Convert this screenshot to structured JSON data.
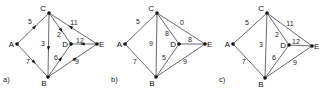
{
  "panels": [
    {
      "caption": "a)",
      "offset_x": 0,
      "directed": true,
      "nodes": {
        "A": [
          17,
          44
        ],
        "C": [
          49,
          13
        ],
        "B": [
          48,
          77
        ],
        "D": [
          71,
          44
        ],
        "E": [
          97,
          44
        ]
      },
      "edges": [
        {
          "from": "A",
          "to": "C",
          "w": "5",
          "lx": 30,
          "ly": 24
        },
        {
          "from": "A",
          "to": "B",
          "w": "7",
          "lx": 28,
          "ly": 64
        },
        {
          "from": "C",
          "to": "B",
          "w": "3",
          "lx": 43,
          "ly": 46
        },
        {
          "from": "C",
          "to": "D",
          "w": "2",
          "lx": 59,
          "ly": 37
        },
        {
          "from": "E",
          "to": "C",
          "w": "11",
          "lx": 74,
          "ly": 25
        },
        {
          "from": "E",
          "to": "D",
          "w": "12",
          "lx": 80,
          "ly": 43
        },
        {
          "from": "B",
          "to": "D",
          "w": "6",
          "lx": 56,
          "ly": 60
        },
        {
          "from": "B",
          "to": "E",
          "w": "9",
          "lx": 77,
          "ly": 64
        }
      ]
    },
    {
      "caption": "b)",
      "offset_x": 108,
      "directed": false,
      "nodes": {
        "A": [
          17,
          44
        ],
        "C": [
          49,
          13
        ],
        "B": [
          48,
          77
        ],
        "D": [
          71,
          44
        ],
        "E": [
          97,
          44
        ]
      },
      "edges": [
        {
          "from": "A",
          "to": "C",
          "w": "5",
          "lx": 30,
          "ly": 24
        },
        {
          "from": "A",
          "to": "B",
          "w": "7",
          "lx": 27,
          "ly": 64
        },
        {
          "from": "C",
          "to": "B",
          "w": "9",
          "lx": 43,
          "ly": 46
        },
        {
          "from": "C",
          "to": "D",
          "w": "8",
          "lx": 59,
          "ly": 36
        },
        {
          "from": "C",
          "to": "E",
          "w": "0",
          "lx": 74,
          "ly": 25
        },
        {
          "from": "D",
          "to": "E",
          "w": "8",
          "lx": 82,
          "ly": 42
        },
        {
          "from": "B",
          "to": "D",
          "w": "5",
          "lx": 56,
          "ly": 60
        },
        {
          "from": "B",
          "to": "E",
          "w": "9",
          "lx": 77,
          "ly": 64
        }
      ]
    },
    {
      "caption": "c)",
      "offset_x": 216,
      "directed": false,
      "nodes": {
        "A": [
          17,
          44
        ],
        "C": [
          51,
          13
        ],
        "B": [
          49,
          78
        ],
        "D": [
          73,
          45
        ],
        "E": [
          96,
          46
        ]
      },
      "edges": [
        {
          "from": "A",
          "to": "C",
          "w": "5",
          "lx": 31,
          "ly": 25
        },
        {
          "from": "A",
          "to": "B",
          "w": "7",
          "lx": 28,
          "ly": 64
        },
        {
          "from": "C",
          "to": "B",
          "w": "3",
          "lx": 45,
          "ly": 47
        },
        {
          "from": "C",
          "to": "D",
          "w": "2",
          "lx": 61,
          "ly": 37
        },
        {
          "from": "C",
          "to": "E",
          "w": "11",
          "lx": 74,
          "ly": 26
        },
        {
          "from": "D",
          "to": "E",
          "w": "12",
          "lx": 80,
          "ly": 44
        },
        {
          "from": "B",
          "to": "D",
          "w": "6",
          "lx": 58,
          "ly": 60
        },
        {
          "from": "B",
          "to": "E",
          "w": "9",
          "lx": 79,
          "ly": 65
        }
      ]
    }
  ]
}
